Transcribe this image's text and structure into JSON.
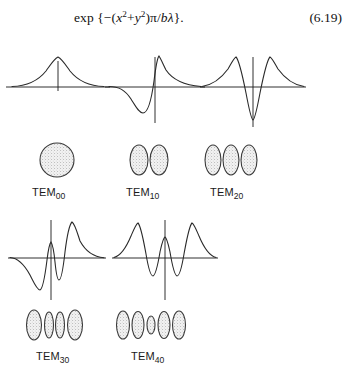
{
  "figure": {
    "background_color": "#ffffff",
    "ink_color": "#1a1a1a",
    "spot_fill_color": "#e8e8e8",
    "equation": {
      "expression": "exp {−(x² + y²)π/bλ}.",
      "lead": "exp {",
      "minus": "−(",
      "var_x": "x",
      "sup2_a": "2",
      "plus": "+",
      "var_y": "y",
      "sup2_b": "2",
      "tail": ")π/",
      "var_b": "b",
      "var_lambda": "λ",
      "close": "}.",
      "number": "(6.19)"
    },
    "modes": [
      {
        "id": "tem00",
        "label_prefix": "TEM",
        "label_subscript": "00",
        "spot_count": 1,
        "spot_shape": "circle",
        "plot_description": "single centered gaussian lobe, all positive",
        "amplitudes": [
          1.0
        ],
        "symmetry": "even"
      },
      {
        "id": "tem10",
        "label_prefix": "TEM",
        "label_subscript": "10",
        "spot_count": 2,
        "spot_shape": "ellipse",
        "plot_description": "odd mode, one positive lobe right of axis, one negative lobe left",
        "amplitudes": [
          -1.0,
          1.0
        ],
        "symmetry": "odd"
      },
      {
        "id": "tem20",
        "label_prefix": "TEM",
        "label_subscript": "20",
        "spot_count": 3,
        "spot_shape": "ellipse",
        "plot_description": "even mode, two positive outer lobes with deep negative central trough",
        "amplitudes": [
          1.0,
          -1.6,
          1.0
        ],
        "symmetry": "even"
      },
      {
        "id": "tem30",
        "label_prefix": "TEM",
        "label_subscript": "30",
        "spot_count": 4,
        "spot_shape": "ellipse",
        "plot_description": "odd mode with four alternating lobes",
        "amplitudes": [
          -1.0,
          0.75,
          -0.75,
          1.0
        ],
        "symmetry": "odd"
      },
      {
        "id": "tem40",
        "label_prefix": "TEM",
        "label_subscript": "40",
        "spot_count": 5,
        "spot_shape": "ellipse",
        "plot_description": "even mode with five alternating lobes, small central peak",
        "amplitudes": [
          1.0,
          -0.8,
          0.55,
          -0.8,
          1.0
        ],
        "symmetry": "even"
      }
    ]
  }
}
